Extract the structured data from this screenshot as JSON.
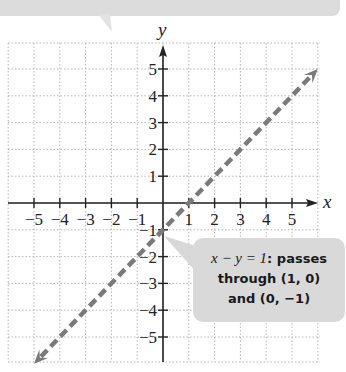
{
  "chart_data": {
    "type": "line",
    "title": "",
    "xlabel": "x",
    "ylabel": "y",
    "xlim": [
      -6,
      6
    ],
    "ylim": [
      -6,
      6
    ],
    "grid": true,
    "x_ticks": [
      -5,
      -4,
      -3,
      -2,
      -1,
      1,
      2,
      3,
      4,
      5
    ],
    "y_ticks": [
      -5,
      -4,
      -3,
      -2,
      -1,
      1,
      2,
      3,
      4,
      5
    ],
    "x_tick_labels": [
      "−5",
      "−4",
      "−3",
      "−2",
      "−1",
      "1",
      "2",
      "3",
      "4",
      "5"
    ],
    "y_tick_labels": [
      "−5",
      "−4",
      "−3",
      "−2",
      "−1",
      "1",
      "2",
      "3",
      "4",
      "5"
    ],
    "series": [
      {
        "name": "x − y = 1",
        "equation": "x - y = 1",
        "style": "dashed",
        "color": "#7a7a7a",
        "arrows_both_ends": true,
        "points": [
          [
            -5,
            -6
          ],
          [
            0,
            -1
          ],
          [
            1,
            0
          ],
          [
            6,
            5
          ]
        ]
      }
    ],
    "annotations": [
      {
        "text_equation": "x − y = 1",
        "text_rest": ": passes",
        "line2": "through (1, 0)",
        "line3": "and (0, −1)",
        "points_to": [
          0,
          -1
        ]
      }
    ],
    "top_callout_partial": "(cut off text at top of image)"
  },
  "colors": {
    "axis": "#222222",
    "grid": "#b5b5b5",
    "line": "#7a7a7a",
    "callout_bg": "#d9d9d9"
  }
}
